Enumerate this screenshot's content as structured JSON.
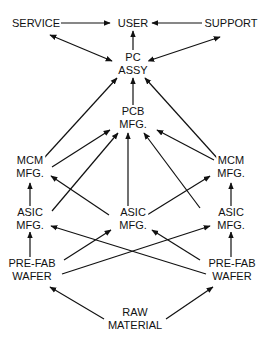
{
  "diagram": {
    "colors": {
      "line": "#111111",
      "text": "#111111",
      "background": "#ffffff"
    },
    "nodes": [
      {
        "id": "service",
        "lines": [
          "SERVICE"
        ],
        "x": 36,
        "y": 23
      },
      {
        "id": "user",
        "lines": [
          "USER"
        ],
        "x": 133,
        "y": 23
      },
      {
        "id": "support",
        "lines": [
          "SUPPORT"
        ],
        "x": 231,
        "y": 23
      },
      {
        "id": "pc_assy",
        "lines": [
          "PC",
          "ASSY"
        ],
        "x": 133,
        "y": 64
      },
      {
        "id": "pcb_mfg",
        "lines": [
          "PCB",
          "MFG."
        ],
        "x": 133,
        "y": 118
      },
      {
        "id": "mcm_left",
        "lines": [
          "MCM",
          "MFG."
        ],
        "x": 30,
        "y": 167
      },
      {
        "id": "mcm_right",
        "lines": [
          "MCM",
          "MFG."
        ],
        "x": 231,
        "y": 167
      },
      {
        "id": "asic_left",
        "lines": [
          "ASIC",
          "MFG."
        ],
        "x": 30,
        "y": 219
      },
      {
        "id": "asic_center",
        "lines": [
          "ASIC",
          "MFG."
        ],
        "x": 133,
        "y": 219
      },
      {
        "id": "asic_right",
        "lines": [
          "ASIC",
          "MFG."
        ],
        "x": 231,
        "y": 219
      },
      {
        "id": "wafer_left",
        "lines": [
          "PRE-FAB",
          "WAFER"
        ],
        "x": 32,
        "y": 270
      },
      {
        "id": "wafer_right",
        "lines": [
          "PRE-FAB",
          "WAFER"
        ],
        "x": 232,
        "y": 270
      },
      {
        "id": "raw_material",
        "lines": [
          "RAW",
          "MATERIAL"
        ],
        "x": 135,
        "y": 319
      }
    ],
    "edges": [
      {
        "from": [
          60,
          23
        ],
        "to": [
          110,
          23
        ],
        "heads": "end"
      },
      {
        "from": [
          202,
          23
        ],
        "to": [
          152,
          23
        ],
        "heads": "end"
      },
      {
        "from": [
          133,
          50
        ],
        "to": [
          133,
          31
        ],
        "heads": "end"
      },
      {
        "from": [
          50,
          35
        ],
        "to": [
          112,
          61
        ],
        "heads": "both"
      },
      {
        "from": [
          220,
          37
        ],
        "to": [
          148,
          61
        ],
        "heads": "both"
      },
      {
        "from": [
          133,
          106
        ],
        "to": [
          133,
          78
        ],
        "heads": "end"
      },
      {
        "from": [
          44,
          158
        ],
        "to": [
          117,
          78
        ],
        "heads": "end"
      },
      {
        "from": [
          218,
          159
        ],
        "to": [
          145,
          78
        ],
        "heads": "end"
      },
      {
        "from": [
          52,
          167
        ],
        "to": [
          110,
          130
        ],
        "heads": "end"
      },
      {
        "from": [
          52,
          211
        ],
        "to": [
          118,
          133
        ],
        "heads": "end"
      },
      {
        "from": [
          128,
          209
        ],
        "to": [
          128,
          133
        ],
        "heads": "end"
      },
      {
        "from": [
          200,
          208
        ],
        "to": [
          144,
          133
        ],
        "heads": "end"
      },
      {
        "from": [
          214,
          160
        ],
        "to": [
          157,
          130
        ],
        "heads": "end"
      },
      {
        "from": [
          30,
          206
        ],
        "to": [
          30,
          183
        ],
        "heads": "end"
      },
      {
        "from": [
          109,
          215
        ],
        "to": [
          51,
          176
        ],
        "heads": "end"
      },
      {
        "from": [
          147,
          215
        ],
        "to": [
          210,
          176
        ],
        "heads": "end"
      },
      {
        "from": [
          231,
          206
        ],
        "to": [
          231,
          183
        ],
        "heads": "end"
      },
      {
        "from": [
          30,
          259
        ],
        "to": [
          30,
          232
        ],
        "heads": "end"
      },
      {
        "from": [
          231,
          259
        ],
        "to": [
          231,
          232
        ],
        "heads": "end"
      },
      {
        "from": [
          64,
          260
        ],
        "to": [
          111,
          230
        ],
        "heads": "end"
      },
      {
        "from": [
          200,
          260
        ],
        "to": [
          152,
          230
        ],
        "heads": "end"
      },
      {
        "from": [
          62,
          274
        ],
        "to": [
          210,
          226
        ],
        "heads": "end"
      },
      {
        "from": [
          206,
          274
        ],
        "to": [
          51,
          226
        ],
        "heads": "end"
      },
      {
        "from": [
          104,
          319
        ],
        "to": [
          50,
          287
        ],
        "heads": "end"
      },
      {
        "from": [
          166,
          319
        ],
        "to": [
          213,
          287
        ],
        "heads": "end"
      }
    ]
  }
}
